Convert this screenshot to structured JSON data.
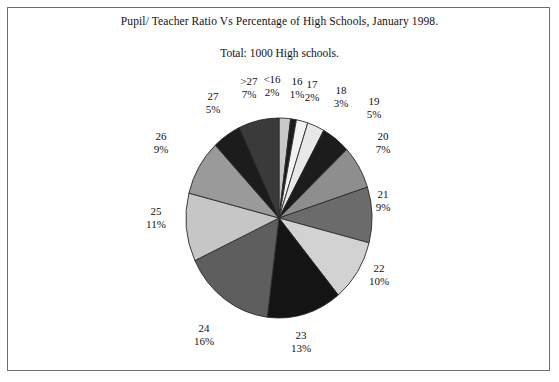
{
  "chart_data": {
    "type": "pie",
    "title": "Pupil/ Teacher Ratio Vs Percentage of High Schools, January 1998.",
    "subtitle": "Total: 1000 High schools.",
    "xlabel": "",
    "ylabel": "",
    "legend_position": "none",
    "grid": false,
    "categories": [
      "<16",
      "16",
      "17",
      "18",
      "19",
      "20",
      "21",
      "22",
      "23",
      "24",
      "25",
      "26",
      "27",
      ">27"
    ],
    "values": [
      2,
      1,
      2,
      3,
      5,
      7,
      9,
      10,
      13,
      16,
      11,
      9,
      5,
      7
    ],
    "units": "percent",
    "slices": [
      {
        "category": "<16",
        "percent": 2,
        "label_pct": "2%",
        "color": "#c9c9c9"
      },
      {
        "category": "16",
        "percent": 1,
        "label_pct": "1%",
        "color": "#1c1c1c"
      },
      {
        "category": "17",
        "percent": 2,
        "label_pct": "2%",
        "color": "#f2f2f2"
      },
      {
        "category": "18",
        "percent": 3,
        "label_pct": "3%",
        "color": "#e8e8e8"
      },
      {
        "category": "19",
        "percent": 5,
        "label_pct": "5%",
        "color": "#1c1c1c"
      },
      {
        "category": "20",
        "percent": 7,
        "label_pct": "7%",
        "color": "#8e8e8e"
      },
      {
        "category": "21",
        "percent": 9,
        "label_pct": "9%",
        "color": "#6b6b6b"
      },
      {
        "category": "22",
        "percent": 10,
        "label_pct": "10%",
        "color": "#d2d2d2"
      },
      {
        "category": "23",
        "percent": 13,
        "label_pct": "13%",
        "color": "#141414"
      },
      {
        "category": "24",
        "percent": 16,
        "label_pct": "16%",
        "color": "#5e5e5e"
      },
      {
        "category": "25",
        "percent": 11,
        "label_pct": "11%",
        "color": "#c6c6c6"
      },
      {
        "category": "26",
        "percent": 9,
        "label_pct": "9%",
        "color": "#9a9a9a"
      },
      {
        "category": "27",
        "percent": 5,
        "label_pct": "5%",
        "color": "#1c1c1c"
      },
      {
        "category": ">27",
        "percent": 7,
        "label_pct": "7%",
        "color": "#3a3a3a"
      }
    ],
    "geometry": {
      "center_x": 279,
      "center_y": 218,
      "radius_x": 93,
      "radius_y": 100,
      "start_angle_deg": -90,
      "direction": "clockwise"
    },
    "label_positions": [
      {
        "category": "<16",
        "x": 272,
        "y": 73,
        "align": "center"
      },
      {
        "category": "16",
        "x": 297,
        "y": 75,
        "align": "center"
      },
      {
        "category": "17",
        "x": 312,
        "y": 78,
        "align": "center"
      },
      {
        "category": "18",
        "x": 341,
        "y": 84,
        "align": "center"
      },
      {
        "category": "19",
        "x": 374,
        "y": 95,
        "align": "center"
      },
      {
        "category": "20",
        "x": 383,
        "y": 130,
        "align": "center"
      },
      {
        "category": "21",
        "x": 383,
        "y": 188,
        "align": "center"
      },
      {
        "category": "22",
        "x": 379,
        "y": 262,
        "align": "center"
      },
      {
        "category": "23",
        "x": 301,
        "y": 329,
        "align": "center"
      },
      {
        "category": "24",
        "x": 204,
        "y": 322,
        "align": "center"
      },
      {
        "category": "25",
        "x": 156,
        "y": 205,
        "align": "center"
      },
      {
        "category": "26",
        "x": 161,
        "y": 130,
        "align": "center"
      },
      {
        "category": "27",
        "x": 213,
        "y": 90,
        "align": "center"
      },
      {
        "category": ">27",
        "x": 249,
        "y": 75,
        "align": "center"
      }
    ],
    "colors": {
      "outline": "#2a2a2a",
      "text": "#111111",
      "frame": "#6e6e6e",
      "background": "#ffffff"
    }
  }
}
